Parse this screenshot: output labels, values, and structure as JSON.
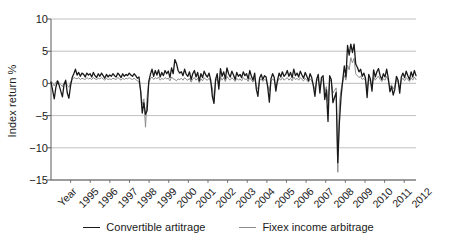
{
  "chart_data": {
    "type": "line",
    "title": "",
    "xlabel": "",
    "ylabel": "Index return %",
    "ylim": [
      -15,
      10
    ],
    "yticks": [
      10,
      5,
      0,
      -5,
      -10,
      -15
    ],
    "ytick_labels": [
      "10",
      "5",
      "0",
      "−5",
      "−10",
      "−15"
    ],
    "grid": "horizontal",
    "legend_position": "bottom",
    "xlabel_first_tick": "Year",
    "xtick_labels": [
      "Year",
      "1995",
      "1996",
      "1997",
      "1998",
      "1999",
      "2000",
      "2001",
      "2002",
      "2003",
      "2004",
      "2005",
      "2006",
      "2007",
      "2008",
      "2009",
      "2010",
      "2011",
      "2012"
    ],
    "x_start_year": 1994,
    "x_end_year": 2012.6,
    "x_frequency": "monthly",
    "series": [
      {
        "name": "Convertible artitrage",
        "color": "#1a1a1a",
        "width": 1.3,
        "values": [
          0.2,
          -1.1,
          -2.4,
          -0.6,
          0.4,
          -0.3,
          -1.2,
          -2.1,
          -0.2,
          0.5,
          -1.5,
          -2.3,
          -0.4,
          0.9,
          1.5,
          2.2,
          1.3,
          1.7,
          1.1,
          1.6,
          1.4,
          1.0,
          1.6,
          1.3,
          1.5,
          1.0,
          1.7,
          1.2,
          0.9,
          1.5,
          1.1,
          1.6,
          1.2,
          0.8,
          1.4,
          1.0,
          1.3,
          1.1,
          1.5,
          1.2,
          1.0,
          1.6,
          1.3,
          0.9,
          1.5,
          1.1,
          1.4,
          1.2,
          1.6,
          1.3,
          1.1,
          1.5,
          1.2,
          0.8,
          1.0,
          -1.2,
          -4.6,
          -3.0,
          -4.8,
          -4.2,
          0.3,
          1.4,
          2.2,
          1.1,
          2.0,
          1.3,
          2.1,
          1.0,
          1.7,
          1.2,
          2.0,
          1.5,
          1.9,
          0.9,
          2.4,
          1.5,
          3.7,
          3.1,
          2.0,
          1.6,
          1.8,
          1.2,
          2.2,
          1.4,
          1.1,
          1.8,
          0.6,
          1.5,
          2.0,
          1.0,
          1.7,
          0.4,
          1.5,
          0.9,
          1.9,
          1.3,
          1.0,
          1.6,
          0.5,
          -2.0,
          -3.1,
          0.6,
          1.5,
          -0.9,
          2.3,
          1.1,
          1.8,
          0.7,
          2.4,
          1.5,
          1.0,
          1.9,
          1.3,
          0.6,
          1.7,
          1.1,
          1.4,
          0.9,
          1.8,
          1.2,
          1.5,
          0.7,
          2.0,
          1.1,
          0.5,
          1.6,
          -0.9,
          -2.0,
          0.8,
          1.4,
          0.6,
          1.2,
          1.0,
          -0.6,
          -2.9,
          0.7,
          1.5,
          0.9,
          -1.2,
          0.5,
          1.6,
          1.0,
          1.8,
          1.1,
          1.4,
          2.0,
          1.1,
          1.7,
          0.9,
          2.2,
          1.2,
          1.6,
          1.0,
          1.9,
          1.3,
          0.8,
          1.7,
          1.1,
          0.4,
          1.5,
          0.9,
          -0.4,
          -2.0,
          0.6,
          1.4,
          -1.5,
          0.9,
          1.2,
          -2.5,
          -1.0,
          -5.9,
          1.2,
          0.6,
          -3.0,
          -2.2,
          -1.4,
          -12.3,
          -6.0,
          -2.1,
          0.4,
          2.7,
          1.0,
          5.9,
          4.4,
          6.1,
          4.8,
          6.1,
          3.0,
          2.5,
          1.8,
          2.2,
          1.1,
          1.6,
          0.8,
          -2.2,
          1.4,
          0.7,
          -1.2,
          2.1,
          1.0,
          1.8,
          2.3,
          1.2,
          0.6,
          1.5,
          1.0,
          2.2,
          0.8,
          -1.3,
          -0.5,
          -1.8,
          -0.9,
          1.1,
          0.5,
          -1.5,
          1.0,
          1.6,
          0.9,
          1.9,
          1.2,
          0.6,
          1.8,
          1.0,
          2.0,
          1.2
        ]
      },
      {
        "name": "Fixex income arbitrage",
        "color": "#8c8c8c",
        "width": 1.0,
        "values": [
          0.3,
          0.1,
          -0.4,
          0.2,
          0.4,
          0.1,
          -0.2,
          -0.5,
          0.1,
          0.3,
          -0.3,
          -0.6,
          0.2,
          0.6,
          0.9,
          0.8,
          0.7,
          0.9,
          0.6,
          0.8,
          0.7,
          0.6,
          0.9,
          0.7,
          0.8,
          0.6,
          0.9,
          0.7,
          0.6,
          0.8,
          0.7,
          0.9,
          0.7,
          0.5,
          0.8,
          0.6,
          0.7,
          0.6,
          0.8,
          0.7,
          0.6,
          0.9,
          0.7,
          0.5,
          0.8,
          0.6,
          0.8,
          0.7,
          0.9,
          0.7,
          0.6,
          0.8,
          0.6,
          0.4,
          0.2,
          -1.0,
          -3.3,
          -2.4,
          -6.8,
          -2.0,
          0.1,
          0.7,
          1.0,
          0.6,
          0.9,
          0.7,
          1.0,
          0.5,
          0.8,
          0.6,
          0.9,
          0.7,
          0.8,
          0.4,
          1.0,
          0.7,
          0.6,
          0.4,
          0.7,
          0.6,
          0.8,
          0.5,
          0.9,
          0.6,
          0.5,
          0.8,
          0.2,
          0.7,
          0.9,
          0.5,
          0.8,
          0.1,
          0.7,
          0.4,
          0.9,
          0.6,
          0.5,
          0.8,
          0.2,
          -0.6,
          -2.9,
          0.3,
          0.8,
          -0.5,
          1.0,
          0.5,
          0.9,
          0.3,
          1.1,
          0.7,
          0.5,
          0.9,
          0.6,
          0.3,
          0.8,
          0.5,
          0.7,
          0.4,
          0.9,
          0.6,
          0.7,
          0.3,
          0.9,
          0.5,
          0.2,
          0.8,
          -0.4,
          -0.9,
          0.4,
          0.7,
          0.3,
          0.6,
          0.5,
          -0.3,
          -1.2,
          0.3,
          0.7,
          0.4,
          -0.5,
          0.2,
          0.8,
          0.5,
          0.9,
          0.5,
          0.7,
          0.9,
          0.5,
          0.8,
          0.4,
          1.0,
          0.6,
          0.8,
          0.5,
          0.9,
          0.6,
          0.4,
          0.8,
          0.5,
          0.2,
          0.7,
          0.4,
          -0.2,
          -1.0,
          0.3,
          0.7,
          -0.8,
          0.4,
          0.6,
          -1.2,
          -0.5,
          -2.8,
          0.6,
          0.3,
          -1.5,
          -1.1,
          -0.7,
          -13.8,
          -3.0,
          -1.0,
          0.2,
          1.3,
          0.5,
          2.8,
          2.1,
          4.0,
          3.2,
          3.9,
          1.5,
          1.2,
          0.9,
          1.1,
          0.6,
          0.8,
          0.4,
          -1.0,
          0.7,
          0.3,
          -0.6,
          1.0,
          0.5,
          0.9,
          1.1,
          0.6,
          0.3,
          0.7,
          0.5,
          1.1,
          0.4,
          -0.6,
          -0.2,
          -0.9,
          -0.4,
          0.6,
          0.2,
          -0.7,
          0.5,
          0.8,
          0.4,
          0.9,
          0.6,
          0.3,
          0.9,
          0.5,
          1.0,
          0.6
        ]
      }
    ],
    "annotations": {
      "crisis_1998_low": -6.8,
      "crisis_2008_low": -13.8,
      "rebound_2009_high": 6.1
    }
  },
  "legend": {
    "items": [
      {
        "label": "Convertible artitrage",
        "color": "#1a1a1a"
      },
      {
        "label": "Fixex income arbitrage",
        "color": "#8c8c8c"
      }
    ]
  },
  "axes": {
    "y_title": "Index return %"
  },
  "colors": {
    "background": "#ffffff",
    "grid": "#b0b0b0",
    "axis": "#5a5a5a",
    "text": "#1a1a1a"
  }
}
